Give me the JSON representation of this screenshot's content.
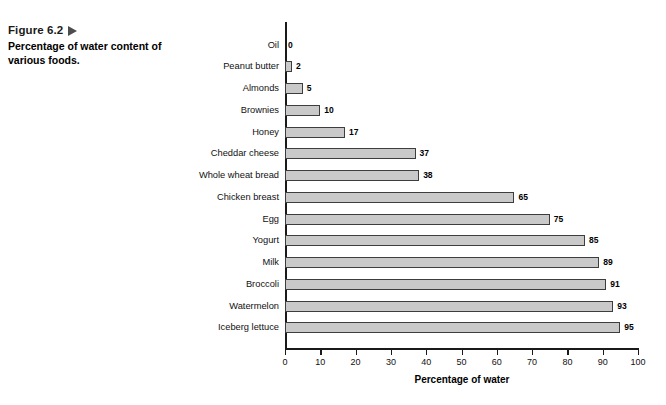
{
  "figure": {
    "number_label": "Figure 6.2",
    "marker_icon": "triangle-right-icon",
    "caption": "Percentage of water content of various foods."
  },
  "chart_data": {
    "type": "bar",
    "orientation": "horizontal",
    "title": "",
    "xlabel": "Percentage of water",
    "ylabel": "",
    "xlim": [
      0,
      100
    ],
    "xticks": [
      0,
      10,
      20,
      30,
      40,
      50,
      60,
      70,
      80,
      90,
      100
    ],
    "grid": false,
    "legend": null,
    "bar_color": "#c9c9c9",
    "bar_border_color": "#3d3d3d",
    "axis_color": "#1a1a1a",
    "categories": [
      "Oil",
      "Peanut butter",
      "Almonds",
      "Brownies",
      "Honey",
      "Cheddar cheese",
      "Whole wheat bread",
      "Chicken breast",
      "Egg",
      "Yogurt",
      "Milk",
      "Broccoli",
      "Watermelon",
      "Iceberg lettuce"
    ],
    "values": [
      0,
      2,
      5,
      10,
      17,
      37,
      38,
      65,
      75,
      85,
      89,
      91,
      93,
      95
    ],
    "value_labels": [
      "0",
      "2",
      "5",
      "10",
      "17",
      "37",
      "38",
      "65",
      "75",
      "85",
      "89",
      "91",
      "93",
      "95"
    ]
  }
}
